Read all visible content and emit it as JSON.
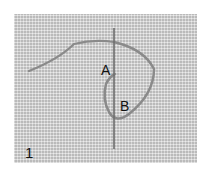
{
  "image": {
    "description": "Embroidery step illustration: thread on woven fabric with needle",
    "labels": {
      "point_a": "A",
      "point_b": "B",
      "step_number": "1"
    },
    "colors": {
      "fabric": "#d2d2d2",
      "thread": "#8a8a8a",
      "needle": "#6e6e6e",
      "background": "#ffffff"
    }
  }
}
